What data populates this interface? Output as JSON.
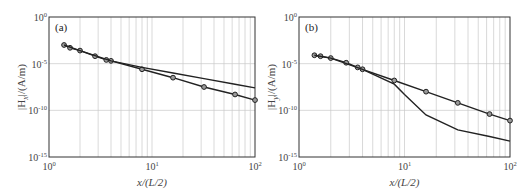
{
  "chart_data": [
    {
      "type": "line",
      "panel_label": "(a)",
      "xlabel": "x/(L/2)",
      "ylabel": "|H_x|/(A/m)",
      "xscale": "log",
      "yscale": "log",
      "xlim": [
        1,
        100
      ],
      "ylim": [
        1e-15,
        1
      ],
      "x_ticks": [
        "10^0",
        "10^1",
        "10^2"
      ],
      "y_ticks": [
        "10^0",
        "10^-5",
        "10^-10",
        "10^-15"
      ],
      "grid": true,
      "series": [
        {
          "name": "with markers",
          "marker": "circle",
          "x": [
            1.4,
            1.6,
            2,
            2.8,
            3.6,
            4,
            8,
            16,
            32,
            64,
            100
          ],
          "log10_y": [
            -3.0,
            -3.3,
            -3.6,
            -4.2,
            -4.6,
            -4.7,
            -5.6,
            -6.5,
            -7.5,
            -8.3,
            -8.9
          ]
        },
        {
          "name": "plain line",
          "marker": "none",
          "x": [
            1.4,
            2,
            4,
            8,
            16,
            32,
            64,
            100
          ],
          "log10_y": [
            -3.0,
            -3.6,
            -4.7,
            -5.4,
            -6.0,
            -6.6,
            -7.2,
            -7.6
          ]
        }
      ]
    },
    {
      "type": "line",
      "panel_label": "(b)",
      "xlabel": "x/(L/2)",
      "ylabel": "|H_y|/(A/m)",
      "xscale": "log",
      "yscale": "log",
      "xlim": [
        1,
        100
      ],
      "ylim": [
        1e-15,
        1
      ],
      "x_ticks": [
        "10^0",
        "10^1",
        "10^2"
      ],
      "y_ticks": [
        "10^0",
        "10^-5",
        "10^-10",
        "10^-15"
      ],
      "grid": true,
      "series": [
        {
          "name": "with markers",
          "marker": "circle",
          "x": [
            1.4,
            1.6,
            2,
            2.8,
            3.6,
            4,
            8,
            16,
            32,
            64,
            100
          ],
          "log10_y": [
            -4.1,
            -4.2,
            -4.4,
            -4.9,
            -5.4,
            -5.6,
            -6.8,
            -8.0,
            -9.2,
            -10.4,
            -11.1
          ]
        },
        {
          "name": "plain line",
          "marker": "none",
          "x": [
            1.4,
            2,
            4,
            8,
            10,
            16,
            32,
            64,
            100
          ],
          "log10_y": [
            -4.1,
            -4.4,
            -5.6,
            -7.2,
            -8.3,
            -10.5,
            -12.1,
            -12.8,
            -13.3
          ]
        }
      ]
    }
  ],
  "labels": {
    "a": {
      "panel": "(a)",
      "ylabel": "|H",
      "ysub": "x",
      "yunit": "|/(A/m)",
      "xlabel": "x/(L/2)"
    },
    "b": {
      "panel": "(b)",
      "ylabel": "|H",
      "ysub": "y",
      "yunit": "|/(A/m)",
      "xlabel": "x/(L/2)"
    },
    "ticks": {
      "ten": "10",
      "x": [
        "0",
        "1",
        "2"
      ],
      "y": [
        "0",
        "-5",
        "-10",
        "-15"
      ]
    }
  }
}
